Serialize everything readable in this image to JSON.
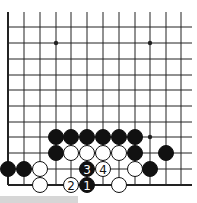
{
  "diagram": {
    "type": "go-board-partial",
    "columns_x": [
      8,
      24,
      40,
      56,
      71,
      87,
      103,
      119,
      135,
      150,
      166,
      181
    ],
    "rows_y": [
      12,
      27,
      43,
      59,
      75,
      90,
      106,
      122,
      137,
      153,
      169,
      185
    ],
    "grid_right": 192,
    "grid_top": 12,
    "left_edge_x": 8,
    "bottom_edge_y": 185,
    "stone_radius": 7.5,
    "colors": {
      "line": "#222222",
      "black": "#111111",
      "white": "#ffffff",
      "bar": "#d6d6d6"
    },
    "hoshi": [
      {
        "col": 3,
        "row": 2
      },
      {
        "col": 9,
        "row": 2
      },
      {
        "col": 9,
        "row": 8
      }
    ],
    "stones": [
      {
        "color": "black",
        "col": 3,
        "row": 8
      },
      {
        "color": "black",
        "col": 4,
        "row": 8
      },
      {
        "color": "black",
        "col": 5,
        "row": 8
      },
      {
        "color": "black",
        "col": 6,
        "row": 8
      },
      {
        "color": "black",
        "col": 7,
        "row": 8
      },
      {
        "color": "black",
        "col": 8,
        "row": 8
      },
      {
        "color": "black",
        "col": 3,
        "row": 9
      },
      {
        "color": "white",
        "col": 4,
        "row": 9
      },
      {
        "color": "white",
        "col": 5,
        "row": 9
      },
      {
        "color": "white",
        "col": 6,
        "row": 9
      },
      {
        "color": "white",
        "col": 7,
        "row": 9
      },
      {
        "color": "black",
        "col": 8,
        "row": 9
      },
      {
        "color": "black",
        "col": 10,
        "row": 9
      },
      {
        "color": "black",
        "col": 0,
        "row": 10
      },
      {
        "color": "black",
        "col": 1,
        "row": 10
      },
      {
        "color": "white",
        "col": 2,
        "row": 10
      },
      {
        "color": "black",
        "col": 5,
        "row": 10,
        "label": "3"
      },
      {
        "color": "white",
        "col": 6,
        "row": 10,
        "label": "4"
      },
      {
        "color": "white",
        "col": 8,
        "row": 10
      },
      {
        "color": "black",
        "col": 9,
        "row": 10
      },
      {
        "color": "white",
        "col": 2,
        "row": 11
      },
      {
        "color": "white",
        "col": 4,
        "row": 11,
        "label": "2"
      },
      {
        "color": "black",
        "col": 5,
        "row": 11,
        "label": "1"
      },
      {
        "color": "white",
        "col": 7,
        "row": 11
      }
    ]
  }
}
